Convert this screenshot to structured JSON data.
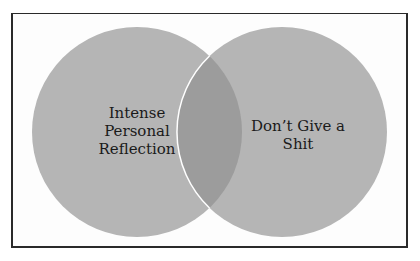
{
  "diagram": {
    "type": "venn",
    "sets": [
      {
        "label_lines": [
          "Intense",
          "Personal",
          "Reflection"
        ],
        "color": "#b5b5b5"
      },
      {
        "label_lines": [
          "Don’t Give a",
          "Shit"
        ],
        "color": "#b5b5b5"
      }
    ],
    "intersection_color": "#9c9c9c",
    "outline_color": "#ffffff",
    "frame_color": "#2a2a2a"
  }
}
